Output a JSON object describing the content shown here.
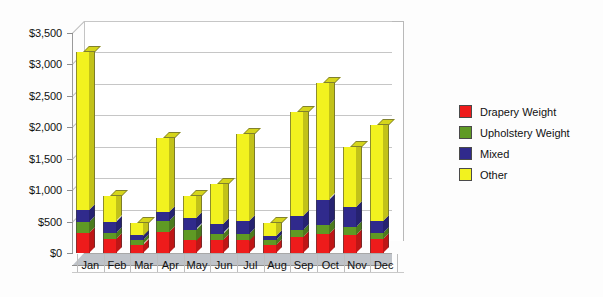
{
  "chart_data": {
    "type": "bar",
    "subtype": "stacked-column-3d",
    "title": "",
    "xlabel": "",
    "ylabel": "",
    "categories": [
      "Jan",
      "Feb",
      "Mar",
      "Apr",
      "May",
      "Jun",
      "Jul",
      "Aug",
      "Sep",
      "Oct",
      "Nov",
      "Dec"
    ],
    "ylim": [
      0,
      3500
    ],
    "ytick_values": [
      0,
      500,
      1000,
      1500,
      2000,
      2500,
      3000,
      3500
    ],
    "ytick_labels": [
      "$0",
      "$500",
      "$1,000",
      "$1,500",
      "$2,000",
      "$2,500",
      "$3,000",
      "$3,500"
    ],
    "grid": true,
    "legend_position": "right",
    "stacked": true,
    "series": [
      {
        "name": "Drapery Weight",
        "color": "#ee1b1b",
        "values": [
          320,
          230,
          130,
          330,
          200,
          210,
          200,
          120,
          250,
          300,
          280,
          220
        ]
      },
      {
        "name": "Upholstery Weight",
        "color": "#5f9a24",
        "values": [
          170,
          90,
          70,
          180,
          170,
          100,
          110,
          80,
          110,
          150,
          130,
          100
        ]
      },
      {
        "name": "Mixed",
        "color": "#302a8c",
        "values": [
          190,
          180,
          80,
          150,
          180,
          150,
          200,
          70,
          230,
          400,
          320,
          190
        ]
      },
      {
        "name": "Other",
        "color": "#f2f21f",
        "values": [
          2520,
          400,
          200,
          1170,
          350,
          640,
          1390,
          210,
          1660,
          1850,
          950,
          1520
        ]
      }
    ],
    "totals": [
      3200,
      900,
      480,
      1830,
      900,
      1100,
      1900,
      480,
      2250,
      2700,
      1680,
      2030
    ]
  },
  "legend": {
    "items": [
      {
        "label": "Drapery Weight",
        "color": "#ee1b1b"
      },
      {
        "label": "Upholstery Weight",
        "color": "#5f9a24"
      },
      {
        "label": "Mixed",
        "color": "#302a8c"
      },
      {
        "label": "Other",
        "color": "#f2f21f"
      }
    ]
  }
}
